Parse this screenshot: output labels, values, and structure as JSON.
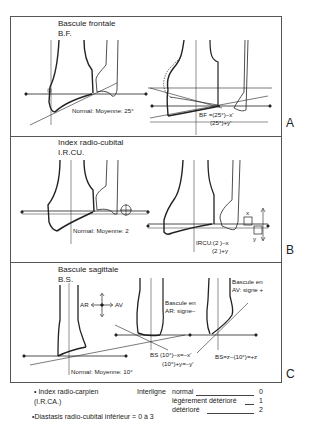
{
  "panels": [
    {
      "letter": "A",
      "title": "Bascule frontale",
      "abbrev": "B.F.",
      "normal_label": "Normal: Moyenne: 25°",
      "formula_line1": "BF =(25°)–x'",
      "formula_line2": "(25°)+y'"
    },
    {
      "letter": "B",
      "title": "Index radio-cubital",
      "abbrev": "I.R.CU.",
      "normal_label": "Normal: Moyenne: 2",
      "formula_line1": "IRCU:(2   )–x",
      "formula_line2": "(2   )+y",
      "marker_x": "x",
      "marker_y": "y"
    },
    {
      "letter": "C",
      "title": "Bascule sagittale",
      "abbrev": "B.S.",
      "normal_label": "Normal: Moyenne: 10°",
      "axis_ar": "AR",
      "axis_av": "AV",
      "note_ar_line1": "Bascule en",
      "note_ar_line2": "AR: signe–",
      "note_av_line1": "Bascule en",
      "note_av_line2": "AV: signe +",
      "formula1_line1": "BS (10°)–x=–x'",
      "formula1_line2": "(10°)+y=–y'",
      "formula2": "BS=z–(10°)=+z"
    }
  ],
  "footer": {
    "index_rc_line1": "• Index radio-carpien",
    "index_rc_line2": "(I.R.CA.)",
    "interligne_label": "Interligne",
    "grades": [
      {
        "label": "normal",
        "value": "0"
      },
      {
        "label": "légèrement détérioré",
        "value": "1"
      },
      {
        "label": "détérioré",
        "value": "2"
      }
    ],
    "diastasis": "•Diastasis radio-cubital inférieur = 0 à 3"
  }
}
